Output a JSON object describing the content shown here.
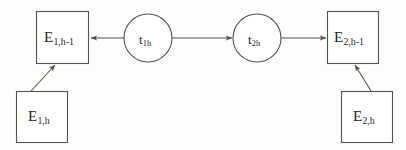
{
  "diagram": {
    "stroke_color": "#55514e",
    "text_color": "#231f1d",
    "background_color": "#fdfdfc",
    "nodes": [
      {
        "id": "e1h1",
        "shape": "rectangle",
        "base": "E",
        "subscript": "1,h-1",
        "x": 36,
        "y": 11,
        "width": 52,
        "height": 52
      },
      {
        "id": "t1h",
        "shape": "circle",
        "base": "t",
        "subscript": "1h",
        "cx": 148,
        "cy": 38,
        "r": 24
      },
      {
        "id": "t2h",
        "shape": "circle",
        "base": "t",
        "subscript": "2h",
        "cx": 257,
        "cy": 38,
        "r": 24
      },
      {
        "id": "e2h1",
        "shape": "rectangle",
        "base": "E",
        "subscript": "2,h-1",
        "x": 327,
        "y": 11,
        "width": 51,
        "height": 52
      },
      {
        "id": "e1h",
        "shape": "rectangle",
        "base": "E",
        "subscript": "1,h",
        "x": 16,
        "y": 91,
        "width": 51,
        "height": 51
      },
      {
        "id": "e2h",
        "shape": "rectangle",
        "base": "E",
        "subscript": "2,h",
        "x": 341,
        "y": 91,
        "width": 51,
        "height": 51
      }
    ],
    "edges": [
      {
        "id": "t1h-to-e1h1",
        "from": "t1h",
        "to": "e1h1",
        "direction": "left",
        "x1": 124,
        "y1": 38,
        "x2": 90,
        "y2": 38
      },
      {
        "id": "t1h-to-t2h",
        "from": "t1h",
        "to": "t2h",
        "direction": "right",
        "x1": 172,
        "y1": 38,
        "x2": 231,
        "y2": 38
      },
      {
        "id": "t2h-to-e2h1",
        "from": "t2h",
        "to": "e2h1",
        "direction": "right",
        "x1": 281,
        "y1": 38,
        "x2": 325,
        "y2": 38
      },
      {
        "id": "e1h-to-e1h1",
        "from": "e1h",
        "to": "e1h1",
        "direction": "up-right",
        "x1": 32,
        "y1": 90,
        "x2": 54,
        "y2": 66
      },
      {
        "id": "e2h-to-e2h1",
        "from": "e2h",
        "to": "e2h1",
        "direction": "up-left",
        "x1": 370,
        "y1": 90,
        "x2": 355,
        "y2": 66
      }
    ]
  }
}
